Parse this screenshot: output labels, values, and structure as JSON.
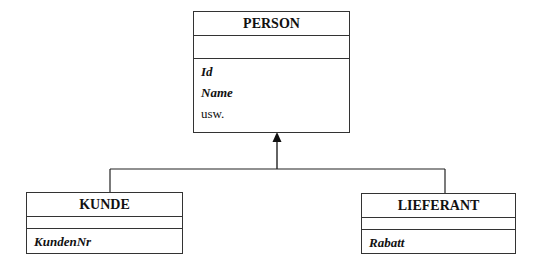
{
  "diagram": {
    "type": "uml-class-inheritance",
    "classes": [
      {
        "id": "person",
        "name": "PERSON",
        "attributes": [
          {
            "label": "Id",
            "style": "bold-italic"
          },
          {
            "label": "Name",
            "style": "bold-italic"
          },
          {
            "label": "usw.",
            "style": "plain"
          }
        ]
      },
      {
        "id": "kunde",
        "name": "KUNDE",
        "attributes": [
          {
            "label": "KundenNr",
            "style": "bold-italic"
          }
        ]
      },
      {
        "id": "lieferant",
        "name": "LIEFERANT",
        "attributes": [
          {
            "label": "Rabatt",
            "style": "bold-italic"
          }
        ]
      }
    ],
    "relations": [
      {
        "type": "generalization",
        "from": "KUNDE",
        "to": "PERSON"
      },
      {
        "type": "generalization",
        "from": "LIEFERANT",
        "to": "PERSON"
      }
    ]
  }
}
